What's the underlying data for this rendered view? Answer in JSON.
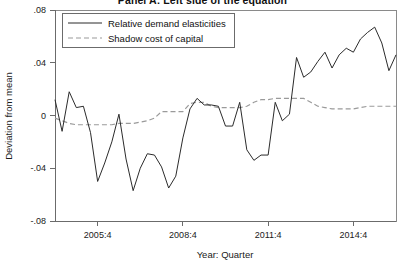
{
  "figure": {
    "title": "Panel A: Left side of the equation",
    "background_color": "#ffffff"
  },
  "legend": {
    "position": "top-left",
    "entries": [
      {
        "label": "Relative demand elasticities",
        "style": "solid",
        "color": "#2b2b2b"
      },
      {
        "label": "Shadow cost of capital",
        "style": "dashed",
        "color": "#9a9a9a"
      }
    ]
  },
  "axes": {
    "y_title": "Deviation from mean",
    "x_title": "Year: Quarter",
    "y_ticklabels": [
      ".08",
      ".04",
      "0",
      "-.04",
      "-.08"
    ],
    "x_ticklabels": [
      "2005:4",
      "2008:4",
      "2011:4",
      "2014:4"
    ]
  },
  "chart_data": {
    "type": "line",
    "title": "Panel A: Left side of the equation",
    "xlabel": "Year: Quarter",
    "ylabel": "Deviation from mean",
    "xlim": [
      2004.25,
      2016.25
    ],
    "ylim": [
      -0.08,
      0.08
    ],
    "grid": false,
    "legend_position": "top-left",
    "x_tick_values": [
      2005.75,
      2008.75,
      2011.75,
      2014.75
    ],
    "x_tick_labels": [
      "2005:4",
      "2008:4",
      "2011:4",
      "2014:4"
    ],
    "y_tick_values": [
      0.08,
      0.04,
      0,
      -0.04,
      -0.08
    ],
    "y_tick_labels": [
      ".08",
      ".04",
      "0",
      "-.04",
      "-.08"
    ],
    "x": [
      2004.25,
      2004.5,
      2004.75,
      2005.0,
      2005.25,
      2005.5,
      2005.75,
      2006.0,
      2006.25,
      2006.5,
      2006.75,
      2007.0,
      2007.25,
      2007.5,
      2007.75,
      2008.0,
      2008.25,
      2008.5,
      2008.75,
      2009.0,
      2009.25,
      2009.5,
      2009.75,
      2010.0,
      2010.25,
      2010.5,
      2010.75,
      2011.0,
      2011.25,
      2011.5,
      2011.75,
      2012.0,
      2012.25,
      2012.5,
      2012.75,
      2013.0,
      2013.25,
      2013.5,
      2013.75,
      2014.0,
      2014.25,
      2014.5,
      2014.75,
      2015.0,
      2015.25,
      2015.5,
      2015.75,
      2016.0,
      2016.25
    ],
    "series": [
      {
        "name": "Relative demand elasticities",
        "style": "solid",
        "color": "#2b2b2b",
        "values": [
          0.012,
          -0.012,
          0.018,
          0.006,
          0.007,
          -0.013,
          -0.05,
          -0.036,
          -0.02,
          0.001,
          -0.033,
          -0.057,
          -0.04,
          -0.029,
          -0.03,
          -0.039,
          -0.055,
          -0.046,
          -0.017,
          0.005,
          0.013,
          0.008,
          0.008,
          0.007,
          -0.008,
          -0.008,
          0.01,
          -0.026,
          -0.034,
          -0.03,
          -0.03,
          0.01,
          -0.004,
          0.001,
          0.044,
          0.029,
          0.033,
          0.041,
          0.048,
          0.036,
          0.046,
          0.051,
          0.048,
          0.058,
          0.063,
          0.067,
          0.055,
          0.034,
          0.046
        ]
      },
      {
        "name": "Shadow cost of capital",
        "style": "dashed",
        "color": "#9a9a9a",
        "values": [
          -0.002,
          -0.004,
          -0.006,
          -0.007,
          -0.007,
          -0.007,
          -0.007,
          -0.007,
          -0.007,
          -0.006,
          -0.006,
          -0.006,
          -0.005,
          -0.004,
          -0.002,
          0.003,
          0.003,
          0.003,
          0.003,
          0.009,
          0.01,
          0.01,
          0.007,
          0.006,
          0.006,
          0.006,
          0.006,
          0.007,
          0.01,
          0.012,
          0.012,
          0.013,
          0.013,
          0.013,
          0.013,
          0.013,
          0.01,
          0.007,
          0.006,
          0.005,
          0.005,
          0.005,
          0.005,
          0.006,
          0.007,
          0.007,
          0.007,
          0.007,
          0.007
        ]
      }
    ]
  }
}
